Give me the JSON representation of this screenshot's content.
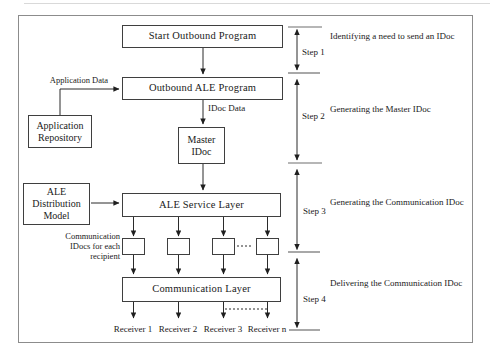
{
  "diagram": {
    "boxes": {
      "start_outbound_program": "Start Outbound Program",
      "outbound_ale_program": "Outbound ALE Program",
      "application_repository": "Application\nRepository",
      "master_idoc": "Master\nIDoc",
      "ale_distribution_model": "ALE\nDistribution\nModel",
      "ale_service_layer": "ALE Service Layer",
      "communication_layer": "Communication Layer"
    },
    "edge_labels": {
      "application_data": "Application Data",
      "idoc_data": "IDoc Data",
      "communication_idocs": "Communication\nIDocs for each\nrecipient"
    },
    "receivers": [
      "Receiver 1",
      "Receiver 2",
      "Receiver 3",
      "Receiver n"
    ],
    "steps": [
      {
        "label": "Step 1",
        "description": "Identifying a need to send an IDoc"
      },
      {
        "label": "Step 2",
        "description": "Generating the Master IDoc"
      },
      {
        "label": "Step 3",
        "description": "Generating the Communication IDoc"
      },
      {
        "label": "Step 4",
        "description": "Delivering the Communication IDoc"
      }
    ],
    "colors": {
      "line": "#2b2b2b",
      "box_border": "#3f3f3f",
      "outer_border": "#8c8c8c",
      "text": "#1a1a1a",
      "background": "#ffffff"
    }
  }
}
